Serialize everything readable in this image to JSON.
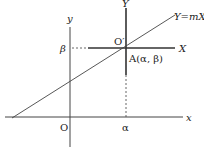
{
  "diagram": {
    "type": "coordinate-translation",
    "axes": {
      "x_label": "x",
      "y_label": "y",
      "origin_label": "O",
      "X_label": "X",
      "Y_label": "Y",
      "new_origin_label": "O′"
    },
    "point": {
      "label": "A(α, β)",
      "alpha_label": "α",
      "beta_label": "β"
    },
    "line": {
      "label": "Y=mX"
    },
    "colors": {
      "stroke": "#333333",
      "background": "#ffffff"
    }
  }
}
